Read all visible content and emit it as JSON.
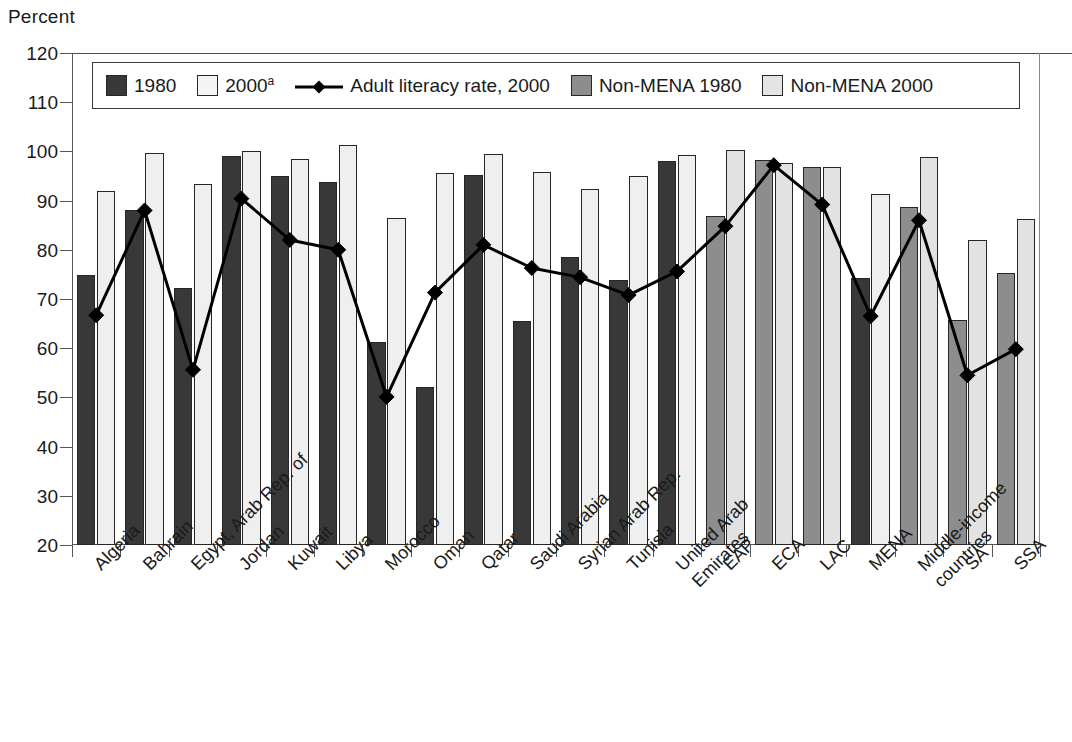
{
  "axis": {
    "y_title": "Percent",
    "y_ticks": [
      120,
      110,
      100,
      90,
      80,
      70,
      60,
      50,
      40,
      30,
      20
    ],
    "y_min": 20,
    "y_max": 120
  },
  "legend": {
    "items": [
      {
        "label": "1980",
        "marker": "square-dark-swatch",
        "color": "#383838"
      },
      {
        "label": "2000",
        "superscript": "a",
        "marker": "square-light-swatch",
        "color": "#f4f4f4"
      },
      {
        "label": "Adult literacy rate, 2000",
        "marker": "line-diamond-marker",
        "color": "#000000"
      },
      {
        "label": "Non-MENA 1980",
        "marker": "square-gray-swatch",
        "color": "#8d8d8d"
      },
      {
        "label": "Non-MENA 2000",
        "marker": "square-lightgray-swatch",
        "color": "#e4e4e4"
      }
    ]
  },
  "chart_data": {
    "type": "bar",
    "title": "",
    "xlabel": "",
    "ylabel": "Percent",
    "ylim": [
      20,
      120
    ],
    "grid": false,
    "legend_position": "top-inside",
    "categories": [
      "Algeria",
      "Bahrain",
      "Egypt, Arab Rep. of",
      "Jordan",
      "Kuwait",
      "Libya",
      "Morocco",
      "Oman",
      "Qatar",
      "Saudi Arabia",
      "Syrian Arab Rep.",
      "Tunisia",
      "United Arab Emirates",
      "EAP",
      "ECA",
      "LAC",
      "MENA",
      "Middle-income countries",
      "SA",
      "SSA"
    ],
    "category_groups": [
      "mena",
      "mena",
      "mena",
      "mena",
      "mena",
      "mena",
      "mena",
      "mena",
      "mena",
      "mena",
      "mena",
      "mena",
      "mena",
      "non-mena",
      "non-mena",
      "non-mena",
      "mena",
      "non-mena",
      "non-mena",
      "non-mena"
    ],
    "series": [
      {
        "name": "1980",
        "type": "bar",
        "color": "#383838",
        "values": [
          74.8,
          88.0,
          72.3,
          99.0,
          95.0,
          93.7,
          61.2,
          52.1,
          95.2,
          65.6,
          78.6,
          73.9,
          98.1,
          null,
          null,
          null,
          74.2,
          null,
          null,
          null
        ]
      },
      {
        "name": "2000",
        "type": "bar",
        "color": "#efefef",
        "values": [
          92.0,
          99.7,
          93.3,
          100.1,
          98.4,
          101.4,
          86.5,
          95.6,
          99.5,
          95.9,
          92.3,
          95.0,
          99.3,
          null,
          null,
          null,
          91.3,
          null,
          null,
          null
        ]
      },
      {
        "name": "Non-MENA 1980",
        "type": "bar",
        "color": "#8d8d8d",
        "values": [
          null,
          null,
          null,
          null,
          null,
          null,
          null,
          null,
          null,
          null,
          null,
          null,
          null,
          86.9,
          98.2,
          96.8,
          null,
          88.7,
          65.8,
          75.2
        ]
      },
      {
        "name": "Non-MENA 2000",
        "type": "bar",
        "color": "#e2e2e2",
        "values": [
          null,
          null,
          null,
          null,
          null,
          null,
          null,
          null,
          null,
          null,
          null,
          null,
          null,
          100.3,
          97.6,
          96.8,
          null,
          98.9,
          81.9,
          86.3
        ]
      },
      {
        "name": "Adult literacy rate, 2000",
        "type": "line",
        "color": "#000000",
        "marker": "diamond",
        "values": [
          66.7,
          88.0,
          55.6,
          90.4,
          82.0,
          80.0,
          50.1,
          71.3,
          81.0,
          76.3,
          74.4,
          70.8,
          75.6,
          84.8,
          97.2,
          89.2,
          66.5,
          86.0,
          54.5,
          59.8
        ]
      }
    ]
  }
}
